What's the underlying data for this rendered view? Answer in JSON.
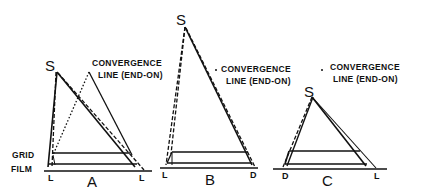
{
  "labels": {
    "grid": "GRID",
    "film": "FILM",
    "source": "S",
    "conv_a_line1": "CONVERGENCE",
    "conv_a_line2": "LINE (END-ON)",
    "conv_b_line1": "CONVERGENCE",
    "conv_b_line2": "LINE (END-ON)",
    "conv_c_line1": "CONVERGENCE",
    "conv_c_line2": "LINE (END-ON)"
  },
  "panels": [
    {
      "id": "A",
      "left_end": "L",
      "right_end": "L"
    },
    {
      "id": "B",
      "left_end": "L",
      "right_end": "D"
    },
    {
      "id": "C",
      "left_end": "D",
      "right_end": "L"
    }
  ],
  "colors": {
    "ink": "#111111",
    "background": "#ffffff"
  }
}
